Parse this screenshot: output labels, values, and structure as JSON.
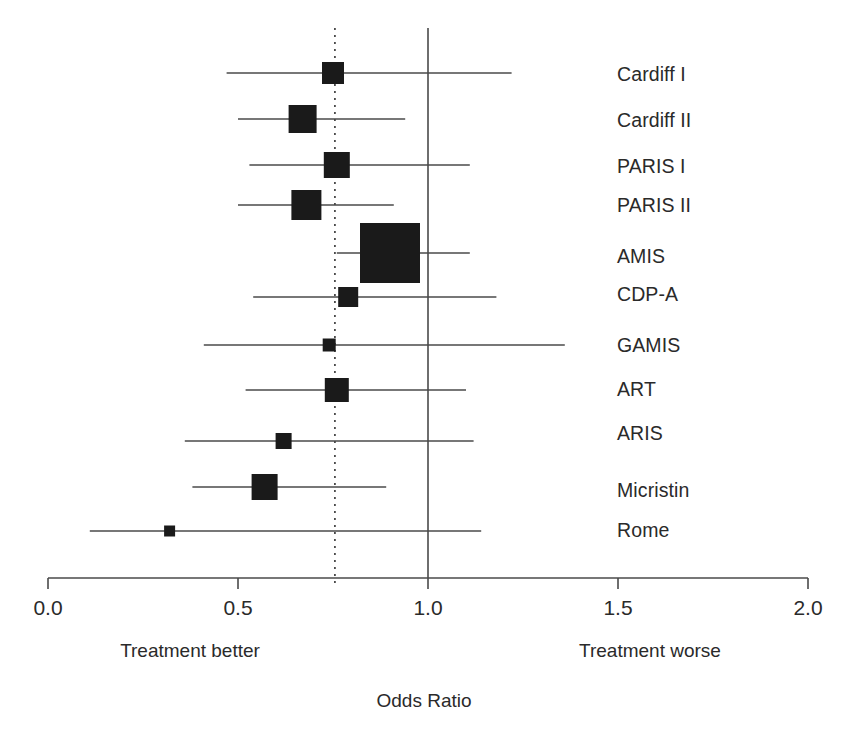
{
  "chart_data": {
    "type": "scatter",
    "subtype": "forest-plot",
    "title": "",
    "xlabel": "Odds Ratio",
    "ylabel": "",
    "xlim": [
      0.0,
      2.0
    ],
    "xticks": [
      0.0,
      0.5,
      1.0,
      1.5,
      2.0
    ],
    "xtick_labels": [
      "0.0",
      "0.5",
      "1.0",
      "1.5",
      "2.0"
    ],
    "grid": false,
    "legend": "none",
    "null_line": 1.0,
    "pooled_line": 0.755,
    "annotations": {
      "left_note": "Treatment better",
      "right_note": "Treatment worse"
    },
    "categories": [
      "Cardiff I",
      "Cardiff II",
      "PARIS I",
      "PARIS II",
      "AMIS",
      "CDP-A",
      "GAMIS",
      "ART",
      "ARIS",
      "Micristin",
      "Rome"
    ],
    "series": [
      {
        "name": "Odds Ratio",
        "values": [
          0.75,
          0.67,
          0.76,
          0.68,
          0.9,
          0.79,
          0.74,
          0.76,
          0.62,
          0.57,
          0.32
        ]
      },
      {
        "name": "CI lower",
        "values": [
          0.47,
          0.5,
          0.53,
          0.5,
          0.76,
          0.54,
          0.41,
          0.52,
          0.36,
          0.38,
          0.11
        ]
      },
      {
        "name": "CI upper",
        "values": [
          1.22,
          0.94,
          1.11,
          0.91,
          1.11,
          1.18,
          1.36,
          1.1,
          1.12,
          0.89,
          1.14
        ]
      },
      {
        "name": "Marker size (weight)",
        "values": [
          22,
          28,
          26,
          30,
          60,
          20,
          13,
          24,
          16,
          26,
          11
        ]
      }
    ],
    "studies": [
      {
        "label": "Cardiff I",
        "or": 0.75,
        "ci_low": 0.47,
        "ci_high": 1.22,
        "box": 22
      },
      {
        "label": "Cardiff II",
        "or": 0.67,
        "ci_low": 0.5,
        "ci_high": 0.94,
        "box": 28
      },
      {
        "label": "PARIS I",
        "or": 0.76,
        "ci_low": 0.53,
        "ci_high": 1.11,
        "box": 26
      },
      {
        "label": "PARIS II",
        "or": 0.68,
        "ci_low": 0.5,
        "ci_high": 0.91,
        "box": 30
      },
      {
        "label": "AMIS",
        "or": 0.9,
        "ci_low": 0.76,
        "ci_high": 1.11,
        "box": 60
      },
      {
        "label": "CDP-A",
        "or": 0.79,
        "ci_low": 0.54,
        "ci_high": 1.18,
        "box": 20
      },
      {
        "label": "GAMIS",
        "or": 0.74,
        "ci_low": 0.41,
        "ci_high": 1.36,
        "box": 13
      },
      {
        "label": "ART",
        "or": 0.76,
        "ci_low": 0.52,
        "ci_high": 1.1,
        "box": 24
      },
      {
        "label": "ARIS",
        "or": 0.62,
        "ci_low": 0.36,
        "ci_high": 1.12,
        "box": 16
      },
      {
        "label": "Micristin",
        "or": 0.57,
        "ci_low": 0.38,
        "ci_high": 0.89,
        "box": 26
      },
      {
        "label": "Rome",
        "or": 0.32,
        "ci_low": 0.11,
        "ci_high": 1.14,
        "box": 11
      }
    ]
  },
  "axis": {
    "title": "Odds Ratio",
    "tick_labels": [
      "0.0",
      "0.5",
      "1.0",
      "1.5",
      "2.0"
    ]
  },
  "notes": {
    "left": "Treatment better",
    "right": "Treatment worse"
  },
  "colors": {
    "marker": "#1a1a1a",
    "line": "#4a4a4a",
    "text": "#2a2a2a",
    "background": "#ffffff"
  }
}
